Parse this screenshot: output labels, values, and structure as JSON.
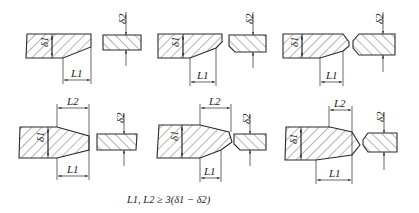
{
  "diagram": {
    "type": "engineering-drawing",
    "labels": {
      "thick_plate": "δ1",
      "thin_plate": "δ2",
      "taper_length_1": "L1",
      "taper_length_2": "L2"
    },
    "formula": "L1, L2 ≥ 3(δ1 − δ2)",
    "rows": [
      {
        "name": "single-side-taper",
        "figures": [
          {
            "variant": "square-end",
            "dims": [
              "δ1",
              "L1",
              "δ2"
            ]
          },
          {
            "variant": "chamfered-end",
            "dims": [
              "δ1",
              "L1",
              "δ2"
            ]
          },
          {
            "variant": "double-chamfered-end",
            "dims": [
              "δ1",
              "L1",
              "δ2"
            ]
          }
        ]
      },
      {
        "name": "double-side-taper",
        "figures": [
          {
            "variant": "square-end",
            "dims": [
              "δ1",
              "L1",
              "L2",
              "δ2"
            ]
          },
          {
            "variant": "chamfered-end",
            "dims": [
              "δ1",
              "L1",
              "L2",
              "δ2"
            ]
          },
          {
            "variant": "double-chamfered-end",
            "dims": [
              "δ1",
              "L1",
              "L2",
              "δ2"
            ]
          }
        ]
      }
    ],
    "colors": {
      "line": "#2a2a2a",
      "background": "#ffffff"
    }
  }
}
